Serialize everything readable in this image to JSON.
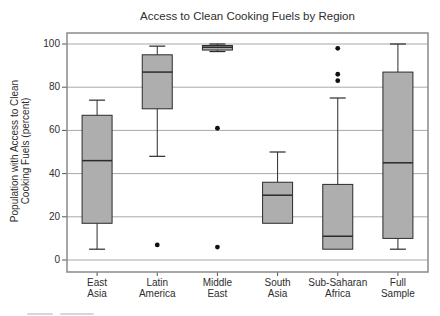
{
  "chart_data": {
    "type": "boxplot",
    "title": "Access to Clean Cooking Fuels by Region",
    "ylabel_lines": [
      "Population with Access to Clean",
      "Cooking Fuels (percent)"
    ],
    "xlabel": "",
    "categories": [
      "East Asia",
      "Latin America",
      "Middle East",
      "South Asia",
      "Sub-Saharan Africa",
      "Full Sample"
    ],
    "yticks": [
      0,
      20,
      40,
      60,
      80,
      100
    ],
    "ylim": [
      -5,
      105
    ],
    "grid": true,
    "legend": "none",
    "series": [
      {
        "category": "East Asia",
        "whisker_low": 5,
        "q1": 17,
        "median": 46,
        "q3": 67,
        "whisker_high": 74,
        "outliers": []
      },
      {
        "category": "Latin America",
        "whisker_low": 48,
        "q1": 70,
        "median": 87,
        "q3": 95,
        "whisker_high": 99,
        "outliers": [
          7
        ]
      },
      {
        "category": "Middle East",
        "whisker_low": 96.5,
        "q1": 97.2,
        "median": 98.5,
        "q3": 99.3,
        "whisker_high": 100,
        "outliers": [
          61,
          6
        ]
      },
      {
        "category": "South Asia",
        "whisker_low": 17,
        "q1": 17,
        "median": 30,
        "q3": 36,
        "whisker_high": 50,
        "outliers": []
      },
      {
        "category": "Sub-Saharan Africa",
        "whisker_low": 5,
        "q1": 5,
        "median": 11,
        "q3": 35,
        "whisker_high": 75,
        "outliers": [
          98,
          86,
          83
        ]
      },
      {
        "category": "Full Sample",
        "whisker_low": 5,
        "q1": 10,
        "median": 45,
        "q3": 87,
        "whisker_high": 100,
        "outliers": []
      }
    ],
    "colors": {
      "box_fill": "#aeaeae",
      "box_stroke": "#2b2b2b",
      "gridline": "#a8a8a8",
      "frame": "#8a8a8a",
      "tick": "#555555",
      "text": "#2e2e2e",
      "outlier": "#111111",
      "background": "#ffffff"
    }
  }
}
